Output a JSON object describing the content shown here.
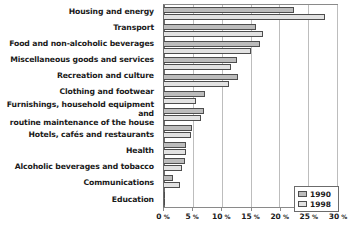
{
  "chart_data": {
    "type": "bar",
    "orientation": "horizontal",
    "title": "",
    "xlabel": "",
    "ylabel": "",
    "xlim": [
      0,
      30
    ],
    "xticks": [
      0,
      5,
      10,
      15,
      20,
      25,
      30
    ],
    "xticklabels": [
      "0 %",
      "5 %",
      "10 %",
      "15 %",
      "20 %",
      "25 %",
      "30 %"
    ],
    "tick_unit": "%",
    "grid": true,
    "legend_position": "bottom-right",
    "categories": [
      "Housing and energy",
      "Transport",
      "Food and non-alcoholic beverages",
      "Miscellaneous goods and services",
      "Recreation and culture",
      "Clothing and footwear",
      "Furnishings, household equipment and routine maintenance of the house",
      "Hotels, cafés and restaurants",
      "Health",
      "Alcoholic beverages and tobacco",
      "Communications",
      "Education"
    ],
    "category_lines": [
      [
        "Housing and energy"
      ],
      [
        "Transport"
      ],
      [
        "Food and non-alcoholic beverages"
      ],
      [
        "Miscellaneous goods and services"
      ],
      [
        "Recreation and culture"
      ],
      [
        "Clothing and footwear"
      ],
      [
        "Furnishings, household equipment and",
        "routine maintenance of the house"
      ],
      [
        "Hotels, cafés and restaurants"
      ],
      [
        "Health"
      ],
      [
        "Alcoholic beverages and tobacco"
      ],
      [
        "Communications"
      ],
      [
        "Education"
      ]
    ],
    "series": [
      {
        "name": "1990",
        "color": "#bcbcbc",
        "values": [
          22.6,
          16.0,
          16.6,
          12.6,
          12.8,
          7.1,
          6.9,
          4.9,
          3.9,
          3.6,
          1.6,
          0.2
        ]
      },
      {
        "name": "1998",
        "color": "#e2e2e2",
        "values": [
          28.0,
          17.1,
          15.0,
          11.6,
          11.3,
          5.6,
          6.5,
          4.7,
          3.8,
          3.2,
          2.7,
          0.2
        ]
      }
    ]
  },
  "legend": {
    "entries": [
      {
        "label": "1990"
      },
      {
        "label": "1998"
      }
    ]
  }
}
